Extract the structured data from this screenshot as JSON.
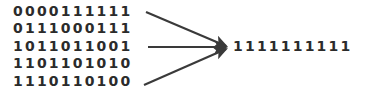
{
  "diagram": {
    "type": "convergence-arrow-diagram",
    "background_color": "#ffffff",
    "text_color": "#2b2b2b",
    "arrow_color": "#3a3a3a",
    "input_rows": [
      {
        "bits": "0000111111",
        "has_arrow": true
      },
      {
        "bits": "0111000111",
        "has_arrow": false
      },
      {
        "bits": "1011011001",
        "has_arrow": true
      },
      {
        "bits": "1101101010",
        "has_arrow": false
      },
      {
        "bits": "1110110100",
        "has_arrow": true
      }
    ],
    "output": {
      "bits": "1111111111"
    },
    "arrows": [
      {
        "from_x": 146,
        "from_y": 12,
        "to_x": 228,
        "to_y": 47
      },
      {
        "from_x": 148,
        "from_y": 47,
        "to_x": 228,
        "to_y": 47
      },
      {
        "from_x": 144,
        "from_y": 85,
        "to_x": 228,
        "to_y": 47
      }
    ]
  }
}
